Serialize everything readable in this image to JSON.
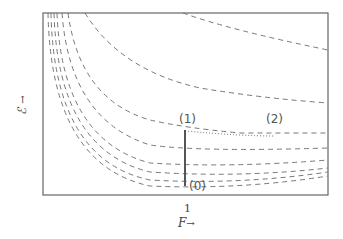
{
  "axes": {
    "x_label": "F",
    "x_arrow": "→",
    "x_tick": "1",
    "y_label": "ℰ",
    "y_arrow": "→"
  },
  "annotations": {
    "point_0": "(0)",
    "point_1": "(1)",
    "point_2": "(2)"
  },
  "colors": {
    "frame": "#666666",
    "curves": "#777777",
    "marker": "#555555"
  }
}
